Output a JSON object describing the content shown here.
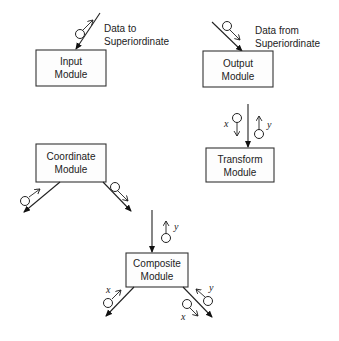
{
  "modules": {
    "input": {
      "line1": "Input",
      "line2": "Module",
      "annotation1": "Data to",
      "annotation2": "Superiordinate"
    },
    "output": {
      "line1": "Output",
      "line2": "Module",
      "annotation1": "Data from",
      "annotation2": "Superiordinate"
    },
    "transform": {
      "line1": "Transform",
      "line2": "Module",
      "couple_in": "x",
      "couple_out": "y"
    },
    "coordinate": {
      "line1": "Coordinate",
      "line2": "Module"
    },
    "composite": {
      "line1": "Composite",
      "line2": "Module",
      "couple_top": "y",
      "couple_left": "x",
      "couple_right_in": "y",
      "couple_right_out": "x"
    }
  },
  "colors": {
    "stroke": "#222222",
    "background": "#ffffff"
  },
  "icons": [
    "data-couple-icon",
    "arrowhead-icon"
  ]
}
